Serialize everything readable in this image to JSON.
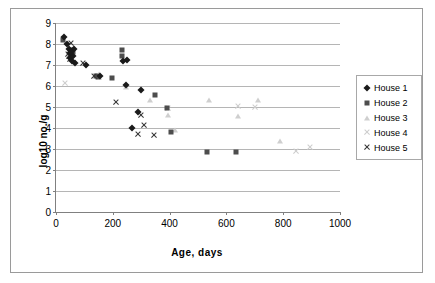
{
  "chart": {
    "type": "scatter",
    "title": "",
    "xlabel": "Age, days",
    "ylabel": "log10 no./g"
  },
  "axes": {
    "x": {
      "min": 0,
      "max": 1000,
      "ticks": [
        "0",
        "200",
        "400",
        "600",
        "800",
        "1000"
      ]
    },
    "y": {
      "min": 0,
      "max": 9,
      "ticks": [
        "0",
        "1",
        "2",
        "3",
        "4",
        "5",
        "6",
        "7",
        "8",
        "9"
      ]
    },
    "grid": "horizontal"
  },
  "legend": {
    "position": "right",
    "items": [
      {
        "label": "House 1",
        "marker": "diamond",
        "color": "#1a1a1a"
      },
      {
        "label": "House 2",
        "marker": "square",
        "color": "#4d4d4d"
      },
      {
        "label": "House 3",
        "marker": "triangle",
        "color": "#cfcfcf"
      },
      {
        "label": "House 4",
        "marker": "x-light",
        "color": "#cccccc"
      },
      {
        "label": "House 5",
        "marker": "x-dark",
        "color": "#333333"
      }
    ]
  },
  "chart_data": {
    "type": "scatter",
    "title": "",
    "xlabel": "Age, days",
    "ylabel": "log10 no./g",
    "xlim": [
      0,
      1000
    ],
    "ylim": [
      0,
      9
    ],
    "grid": true,
    "legend_position": "right",
    "series": [
      {
        "name": "House 1",
        "marker": "diamond",
        "color": "#1a1a1a",
        "points": [
          [
            28,
            8.35
          ],
          [
            40,
            8.0
          ],
          [
            45,
            7.75
          ],
          [
            48,
            7.55
          ],
          [
            50,
            7.35
          ],
          [
            55,
            7.2
          ],
          [
            62,
            7.75
          ],
          [
            68,
            7.1
          ],
          [
            105,
            7.0
          ],
          [
            155,
            6.5
          ],
          [
            235,
            7.2
          ],
          [
            245,
            6.05
          ],
          [
            250,
            7.25
          ],
          [
            300,
            5.8
          ],
          [
            290,
            4.75
          ],
          [
            268,
            4.0
          ],
          [
            60,
            7.45
          ],
          [
            52,
            7.6
          ]
        ]
      },
      {
        "name": "House 2",
        "marker": "square",
        "color": "#4d4d4d",
        "points": [
          [
            24,
            8.2
          ],
          [
            57,
            7.7
          ],
          [
            60,
            7.6
          ],
          [
            140,
            6.5
          ],
          [
            148,
            6.45
          ],
          [
            198,
            6.4
          ],
          [
            232,
            7.7
          ],
          [
            232,
            7.45
          ],
          [
            350,
            5.55
          ],
          [
            390,
            4.95
          ],
          [
            405,
            3.8
          ],
          [
            530,
            2.85
          ],
          [
            635,
            2.85
          ]
        ]
      },
      {
        "name": "House 3",
        "marker": "triangle",
        "color": "#cfcfcf",
        "points": [
          [
            150,
            6.55
          ],
          [
            245,
            5.95
          ],
          [
            330,
            5.35
          ],
          [
            395,
            4.6
          ],
          [
            420,
            3.9
          ],
          [
            540,
            5.35
          ],
          [
            640,
            4.55
          ],
          [
            710,
            5.35
          ],
          [
            790,
            3.4
          ]
        ]
      },
      {
        "name": "House 4",
        "marker": "x-light",
        "color": "#cccccc",
        "points": [
          [
            30,
            6.15
          ],
          [
            150,
            6.4
          ],
          [
            395,
            4.95
          ],
          [
            640,
            5.05
          ],
          [
            700,
            5.0
          ],
          [
            845,
            2.9
          ],
          [
            895,
            3.1
          ]
        ]
      },
      {
        "name": "House 5",
        "marker": "x-dark",
        "color": "#333333",
        "points": [
          [
            53,
            8.05
          ],
          [
            48,
            7.6
          ],
          [
            45,
            7.4
          ],
          [
            50,
            7.3
          ],
          [
            95,
            7.1
          ],
          [
            135,
            6.45
          ],
          [
            210,
            5.25
          ],
          [
            300,
            4.6
          ],
          [
            310,
            4.15
          ],
          [
            290,
            3.7
          ],
          [
            345,
            3.65
          ],
          [
            42,
            7.5
          ]
        ]
      }
    ]
  }
}
